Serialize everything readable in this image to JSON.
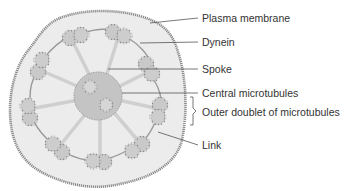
{
  "diagram": {
    "type": "cross-section",
    "colors": {
      "membrane": "#8a8a8a",
      "cytoplasm": "#ececec",
      "ring_zone": "#e3e3e3",
      "tubule_fill": "#c9c9c9",
      "tubule_edge": "#8e8e8e",
      "center_fill": "#c4c4c4",
      "spoke": "#cfcfcf",
      "leader": "#555555",
      "text": "#333333"
    },
    "labels": [
      {
        "id": "plasma-membrane",
        "text": "Plasma membrane",
        "x": 202,
        "y": 12
      },
      {
        "id": "dynein",
        "text": "Dynein",
        "x": 202,
        "y": 36
      },
      {
        "id": "spoke",
        "text": "Spoke",
        "x": 202,
        "y": 63
      },
      {
        "id": "central-microtubules",
        "text": "Central microtubules",
        "x": 202,
        "y": 87
      },
      {
        "id": "outer-doublet",
        "text": "Outer doublet of microtubules",
        "x": 202,
        "y": 106
      },
      {
        "id": "link",
        "text": "Link",
        "x": 202,
        "y": 139
      }
    ],
    "outer_doublet_count": 9,
    "central_microtubule_count": 2
  }
}
